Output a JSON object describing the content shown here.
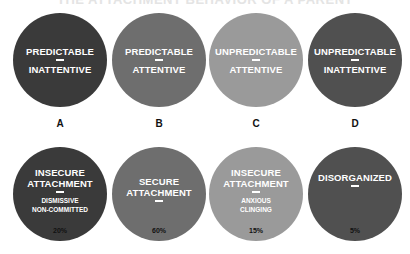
{
  "title": "THE ATTACHMENT BEHAVIOR OF A PARENT",
  "parents": [
    {
      "letter": "A",
      "line1": "PREDICTABLE",
      "line2": "INATTENTIVE",
      "color": "#3a3a3a"
    },
    {
      "letter": "B",
      "line1": "PREDICTABLE",
      "line2": "ATTENTIVE",
      "color": "#6e6e6e"
    },
    {
      "letter": "C",
      "line1": "UNPREDICTABLE",
      "line2": "ATTENTIVE",
      "color": "#9a9a9a"
    },
    {
      "letter": "D",
      "line1": "UNPREDICTABLE",
      "line2": "INATTENTIVE",
      "color": "#505050"
    }
  ],
  "children": [
    {
      "line1": "INSECURE",
      "line2": "ATTACHMENT",
      "sub1": "DISMISSIVE",
      "sub2": "NON-COMMITTED",
      "percent": "20%",
      "color": "#3a3a3a"
    },
    {
      "line1": "SECURE",
      "line2": "ATTACHMENT",
      "sub1": "",
      "sub2": "",
      "percent": "60%",
      "color": "#6e6e6e"
    },
    {
      "line1": "INSECURE",
      "line2": "ATTACHMENT",
      "sub1": "ANXIOUS",
      "sub2": "CLINGING",
      "percent": "15%",
      "color": "#9a9a9a"
    },
    {
      "line1": "DISORGANIZED",
      "line2": "",
      "sub1": "",
      "sub2": "",
      "percent": "5%",
      "color": "#505050"
    }
  ]
}
